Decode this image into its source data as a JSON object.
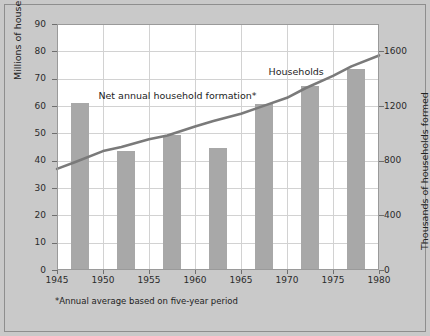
{
  "chart_data": {
    "type": "bar",
    "title": "",
    "subtitle": "",
    "xlabel": "",
    "ylabel": "Millions of households",
    "ylabel_right": "Thousands of households formed",
    "xlim": [
      1945,
      1980
    ],
    "ylim": [
      0,
      90
    ],
    "ylim_right": [
      0,
      1800
    ],
    "grid": true,
    "legend_position": "inline-annotations",
    "x_ticks": [
      "1945",
      "1950",
      "1955",
      "1960",
      "1965",
      "1970",
      "1975",
      "1980"
    ],
    "x_tick_values": [
      1945,
      1950,
      1955,
      1960,
      1965,
      1970,
      1975,
      1980
    ],
    "y_ticks_left": [
      "0",
      "10",
      "20",
      "30",
      "40",
      "50",
      "60",
      "70",
      "80",
      "90"
    ],
    "y_tick_values_left": [
      0,
      10,
      20,
      30,
      40,
      50,
      60,
      70,
      80,
      90
    ],
    "y_ticks_right": [
      "0",
      "400",
      "800",
      "1200",
      "1600"
    ],
    "y_tick_values_right": [
      0,
      400,
      800,
      1200,
      1600
    ],
    "series": [
      {
        "name": "Net annual household formation*",
        "type": "bar",
        "axis": "right",
        "unit": "thousands of households formed",
        "categories": [
          "1945-1950",
          "1950-1955",
          "1955-1960",
          "1960-1965",
          "1965-1970",
          "1970-1975",
          "1975-1980"
        ],
        "x_centers": [
          1947.5,
          1952.5,
          1957.5,
          1962.5,
          1967.5,
          1972.5,
          1977.5
        ],
        "values": [
          1220,
          870,
          985,
          890,
          1215,
          1345,
          1470
        ]
      },
      {
        "name": "Households",
        "type": "line",
        "axis": "left",
        "unit": "millions of households",
        "x": [
          1945,
          1947,
          1950,
          1952,
          1955,
          1957,
          1960,
          1962,
          1965,
          1967,
          1970,
          1972,
          1975,
          1977,
          1980
        ],
        "values": [
          37.0,
          39.5,
          43.5,
          45.0,
          47.8,
          49.2,
          52.5,
          54.5,
          57.2,
          59.5,
          63.0,
          66.5,
          71.0,
          74.5,
          78.5
        ]
      }
    ],
    "annotations": [
      {
        "text": "Net annual household formation*",
        "x": 1949.5,
        "y_left": 63.5
      },
      {
        "text": "Households",
        "x": 1968.0,
        "y_left": 72.5
      }
    ],
    "footnote": "*Annual average based on five-year period"
  },
  "colors": {
    "background": "#c9c9c9",
    "plot_background": "#ffffff",
    "bar_fill": "#a8a8a8",
    "line_stroke": "#7a7a7a",
    "gridline": "#d2d2d2",
    "axis": "#9a9a9a",
    "text": "#1d1d1d"
  }
}
